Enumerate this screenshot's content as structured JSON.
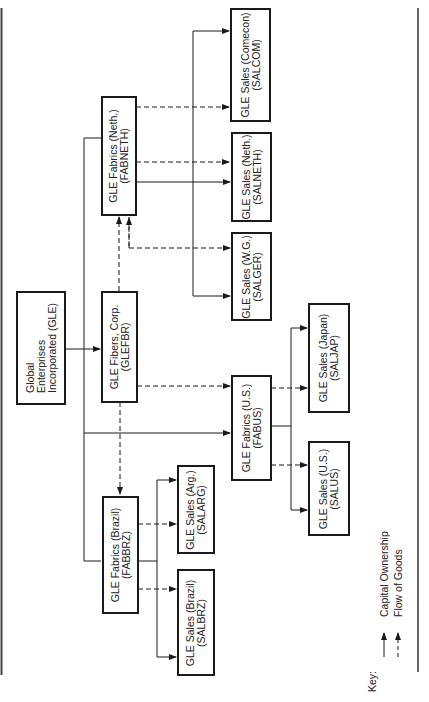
{
  "nodes": {
    "gle": {
      "line1": "Global",
      "line2": "Enterprises",
      "line3": "Incorporated (GLE)"
    },
    "glefbr": {
      "line1": "GLE Fibers, Corp.",
      "line2": "(GLEFBR)"
    },
    "fabneth": {
      "line1": "GLE Fabrics (Neth.)",
      "line2": "(FABNETH)"
    },
    "fabus": {
      "line1": "GLE Fabrics (U.S.)",
      "line2": "(FABUS)"
    },
    "fabbrz": {
      "line1": "GLE Fabrics (Brazil)",
      "line2": "(FABBRZ)"
    },
    "salcom": {
      "line1": "GLE Sales (Comecon)",
      "line2": "(SALCOM)"
    },
    "salneth": {
      "line1": "GLE Sales (Neth.)",
      "line2": "(SALNETH)"
    },
    "salger": {
      "line1": "GLE Sales (W.G.)",
      "line2": "(SALGER)"
    },
    "saljap": {
      "line1": "GLE Sales (Japan)",
      "line2": "(SALJAP)"
    },
    "salus": {
      "line1": "GLE Sales (U.S.)",
      "line2": "(SALUS)"
    },
    "salarg": {
      "line1": "GLE Sales (Arg.)",
      "line2": "(SALARG)"
    },
    "salbrz": {
      "line1": "GLE Sales (Brazil)",
      "line2": "(SALBRZ)"
    }
  },
  "edges": {
    "capital_ownership": [
      [
        "GLE",
        "GLEFBR"
      ],
      [
        "GLE",
        "FABNETH"
      ],
      [
        "GLE",
        "FABUS"
      ],
      [
        "GLE",
        "FABBRZ"
      ],
      [
        "FABNETH",
        "SALCOM"
      ],
      [
        "FABNETH",
        "SALNETH"
      ],
      [
        "FABNETH",
        "SALGER"
      ],
      [
        "FABUS",
        "SALJAP"
      ],
      [
        "FABUS",
        "SALUS"
      ],
      [
        "FABBRZ",
        "SALARG"
      ],
      [
        "FABBRZ",
        "SALBRZ"
      ]
    ],
    "flow_of_goods": [
      [
        "GLEFBR",
        "FABNETH"
      ],
      [
        "GLEFBR",
        "FABUS"
      ],
      [
        "GLEFBR",
        "FABBRZ"
      ],
      [
        "GLEFBR",
        "SALGER"
      ],
      [
        "FABNETH",
        "SALCOM"
      ],
      [
        "FABNETH",
        "SALNETH"
      ],
      [
        "FABUS",
        "SALJAP"
      ],
      [
        "FABUS",
        "SALUS"
      ],
      [
        "FABBRZ",
        "SALARG"
      ],
      [
        "FABBRZ",
        "SALBRZ"
      ]
    ]
  },
  "key": {
    "title": "Key:",
    "solid_label": "Capital Ownership",
    "dashed_label": "Flow of Goods"
  },
  "colors": {
    "line": "#1a1a1a",
    "background": "#ffffff"
  }
}
